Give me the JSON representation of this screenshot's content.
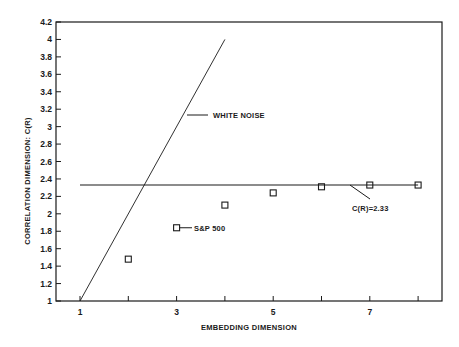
{
  "chart_data": {
    "type": "line",
    "title": "",
    "xlabel": "EMBEDDING DIMENSION",
    "ylabel": "CORRELATION DIMENSION: C(R)",
    "xlim": [
      0.5,
      8.5
    ],
    "ylim": [
      1,
      4.2
    ],
    "x_ticks": [
      1,
      2,
      3,
      4,
      5,
      6,
      7,
      8
    ],
    "x_tick_labels": [
      "1",
      "",
      "3",
      "",
      "5",
      "",
      "7",
      ""
    ],
    "y_ticks": [
      1,
      1.2,
      1.4,
      1.6,
      1.8,
      2,
      2.2,
      2.4,
      2.6,
      2.8,
      3,
      3.2,
      3.4,
      3.6,
      3.8,
      4,
      4.2
    ],
    "y_tick_labels": [
      "1",
      "1.2",
      "1.4",
      "1.6",
      "1.8",
      "2",
      "2.2",
      "2.4",
      "2.6",
      "2.8",
      "3",
      "3.2",
      "3.4",
      "3.6",
      "3.8",
      "4",
      "4.2"
    ],
    "grid": false,
    "series": [
      {
        "name": "WHITE NOISE",
        "style": "line",
        "x": [
          1,
          4
        ],
        "values": [
          1,
          4
        ]
      },
      {
        "name": "S&P 500",
        "style": "square-markers",
        "x": [
          2,
          3,
          4,
          5,
          6,
          7,
          8
        ],
        "values": [
          1.48,
          1.84,
          2.1,
          2.24,
          2.31,
          2.33,
          2.33
        ]
      },
      {
        "name": "C(R)=2.33",
        "style": "horizontal-line",
        "x": [
          1,
          8
        ],
        "values": [
          2.33,
          2.33
        ]
      }
    ],
    "annotations": [
      {
        "text": "WHITE NOISE",
        "target_series": "WHITE NOISE",
        "x": 2.3,
        "y": 3.2
      },
      {
        "text": "S&P 500",
        "target_series": "S&P 500",
        "x": 3,
        "y": 1.84
      },
      {
        "text": "C(R)=2.33",
        "target_series": "C(R)=2.33",
        "x": 6.6,
        "y": 2.33
      }
    ],
    "colors": {
      "ink": "#1a1a1a",
      "background": "#ffffff"
    }
  }
}
